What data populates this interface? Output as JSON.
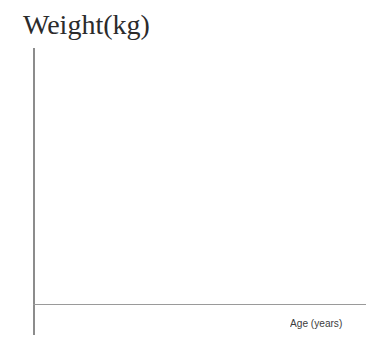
{
  "chart_data": {
    "type": "scatter",
    "title": "Weight(kg)",
    "subtitle": "",
    "xlabel": "Age (years)",
    "ylabel": "Weight(kg)",
    "x": [],
    "values": [],
    "series": [],
    "categories": [],
    "xticklabels": [],
    "yticklabels": [],
    "xlim": null,
    "ylim": null,
    "grid": false,
    "legend": false,
    "legend_position": "none",
    "annotations": []
  },
  "figure": {
    "width": 381,
    "height": 362,
    "background_color": "#ffffff"
  },
  "title": {
    "text": "Weight(kg)"
  },
  "axes": {
    "y_axis": {
      "name": "y-axis-line",
      "color": "#8c8c8c",
      "thickness": "1.6px"
    },
    "x_axis": {
      "name": "x-axis-line",
      "color": "#9a9a9a",
      "thickness": "1.4px"
    },
    "x_label": {
      "text": "Age (years)",
      "color": "#3c3c3c"
    }
  },
  "colors": {
    "background": "#ffffff",
    "title_text": "#2b2b2b",
    "axis_label_text": "#3c3c3c",
    "y_axis_line": "#8c8c8c",
    "x_axis_line": "#9a9a9a"
  }
}
